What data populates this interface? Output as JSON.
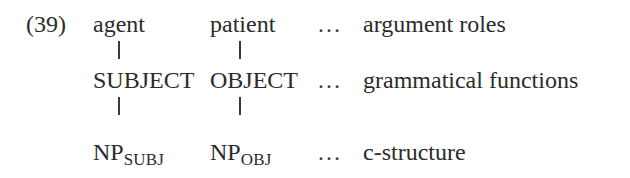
{
  "example": {
    "number": "(39)",
    "rows": [
      {
        "col1": "agent",
        "col2": "patient",
        "ellipsis": "…",
        "label": "argument roles"
      },
      {
        "col1": "SUBJECT",
        "col2": "OBJECT",
        "ellipsis": "…",
        "label": "grammatical functions"
      },
      {
        "col1_base": "NP",
        "col1_sub": "SUBJ",
        "col2_base": "NP",
        "col2_sub": "OBJ",
        "ellipsis": "…",
        "label": "c-structure"
      }
    ]
  }
}
